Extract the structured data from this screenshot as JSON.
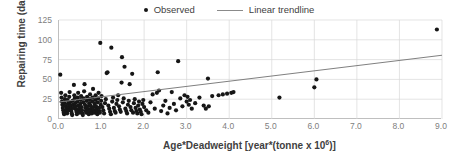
{
  "chart_data": {
    "type": "scatter",
    "title": "",
    "xlabel": "Age*Deadweight [year*(tonne x 10",
    "xlabel_sup": "6",
    "xlabel_tail": ")]",
    "ylabel": "Repairing time (day)",
    "xlim": [
      0,
      9
    ],
    "ylim": [
      0,
      125
    ],
    "xticks": [
      "0.0",
      "1.0",
      "2.0",
      "3.0",
      "4.0",
      "5.0",
      "6.0",
      "7.0",
      "8.0",
      "9.0"
    ],
    "xtick_values": [
      0,
      1,
      2,
      3,
      4,
      5,
      6,
      7,
      8,
      9
    ],
    "yticks": [
      "0",
      "25",
      "50",
      "75",
      "100",
      "125"
    ],
    "ytick_values": [
      0,
      25,
      50,
      75,
      100,
      125
    ],
    "grid": "both",
    "legend_position": "top-center",
    "marker_color": "#161616",
    "trend_color": "#808080",
    "grid_color": "#d9d9d9",
    "axis_color": "#bfbfbf",
    "legend": [
      {
        "label": "Observed",
        "kind": "marker"
      },
      {
        "label": "Linear trendline",
        "kind": "line"
      }
    ],
    "series": [
      {
        "name": "Observed",
        "kind": "scatter",
        "points": [
          [
            0.03,
            56
          ],
          [
            0.05,
            33
          ],
          [
            0.06,
            27
          ],
          [
            0.07,
            22
          ],
          [
            0.08,
            18
          ],
          [
            0.09,
            14
          ],
          [
            0.1,
            11
          ],
          [
            0.11,
            8
          ],
          [
            0.12,
            6
          ],
          [
            0.13,
            20
          ],
          [
            0.14,
            25
          ],
          [
            0.15,
            30
          ],
          [
            0.16,
            16
          ],
          [
            0.17,
            12
          ],
          [
            0.18,
            9
          ],
          [
            0.19,
            7
          ],
          [
            0.2,
            24
          ],
          [
            0.21,
            19
          ],
          [
            0.22,
            15
          ],
          [
            0.23,
            11
          ],
          [
            0.24,
            28
          ],
          [
            0.25,
            34
          ],
          [
            0.26,
            21
          ],
          [
            0.27,
            17
          ],
          [
            0.28,
            13
          ],
          [
            0.29,
            10
          ],
          [
            0.3,
            7
          ],
          [
            0.31,
            5
          ],
          [
            0.32,
            23
          ],
          [
            0.33,
            18
          ],
          [
            0.34,
            14
          ],
          [
            0.35,
            43
          ],
          [
            0.36,
            30
          ],
          [
            0.37,
            26
          ],
          [
            0.38,
            20
          ],
          [
            0.39,
            16
          ],
          [
            0.4,
            12
          ],
          [
            0.41,
            9
          ],
          [
            0.42,
            6
          ],
          [
            0.43,
            22
          ],
          [
            0.44,
            27
          ],
          [
            0.45,
            33
          ],
          [
            0.46,
            17
          ],
          [
            0.47,
            13
          ],
          [
            0.48,
            10
          ],
          [
            0.49,
            8
          ],
          [
            0.5,
            19
          ],
          [
            0.51,
            24
          ],
          [
            0.52,
            29
          ],
          [
            0.53,
            15
          ],
          [
            0.54,
            11
          ],
          [
            0.55,
            7
          ],
          [
            0.56,
            5
          ],
          [
            0.57,
            21
          ],
          [
            0.58,
            26
          ],
          [
            0.59,
            35
          ],
          [
            0.6,
            44
          ],
          [
            0.61,
            18
          ],
          [
            0.62,
            14
          ],
          [
            0.63,
            10
          ],
          [
            0.64,
            8
          ],
          [
            0.65,
            23
          ],
          [
            0.66,
            28
          ],
          [
            0.67,
            16
          ],
          [
            0.68,
            12
          ],
          [
            0.69,
            9
          ],
          [
            0.7,
            6
          ],
          [
            0.71,
            20
          ],
          [
            0.72,
            25
          ],
          [
            0.73,
            31
          ],
          [
            0.74,
            17
          ],
          [
            0.75,
            13
          ],
          [
            0.76,
            10
          ],
          [
            0.77,
            7
          ],
          [
            0.78,
            22
          ],
          [
            0.79,
            27
          ],
          [
            0.8,
            38
          ],
          [
            0.81,
            15
          ],
          [
            0.82,
            11
          ],
          [
            0.83,
            8
          ],
          [
            0.84,
            19
          ],
          [
            0.85,
            24
          ],
          [
            0.86,
            30
          ],
          [
            0.87,
            16
          ],
          [
            0.88,
            12
          ],
          [
            0.89,
            9
          ],
          [
            0.9,
            6
          ],
          [
            0.91,
            21
          ],
          [
            0.92,
            26
          ],
          [
            0.93,
            33
          ],
          [
            0.94,
            14
          ],
          [
            0.95,
            10
          ],
          [
            0.96,
            8
          ],
          [
            0.97,
            96
          ],
          [
            0.98,
            18
          ],
          [
            0.99,
            23
          ],
          [
            1.0,
            29
          ],
          [
            1.02,
            15
          ],
          [
            1.04,
            11
          ],
          [
            1.06,
            7
          ],
          [
            1.08,
            20
          ],
          [
            1.1,
            25
          ],
          [
            1.12,
            58
          ],
          [
            1.14,
            59
          ],
          [
            1.16,
            17
          ],
          [
            1.18,
            13
          ],
          [
            1.2,
            9
          ],
          [
            1.22,
            6
          ],
          [
            1.23,
            90
          ],
          [
            1.25,
            22
          ],
          [
            1.27,
            27
          ],
          [
            1.29,
            14
          ],
          [
            1.31,
            10
          ],
          [
            1.33,
            8
          ],
          [
            1.35,
            19
          ],
          [
            1.37,
            24
          ],
          [
            1.39,
            30
          ],
          [
            1.41,
            16
          ],
          [
            1.43,
            12
          ],
          [
            1.45,
            9
          ],
          [
            1.47,
            46
          ],
          [
            1.48,
            78
          ],
          [
            1.5,
            21
          ],
          [
            1.52,
            26
          ],
          [
            1.54,
            66
          ],
          [
            1.56,
            13
          ],
          [
            1.58,
            10
          ],
          [
            1.6,
            7
          ],
          [
            1.62,
            18
          ],
          [
            1.64,
            23
          ],
          [
            1.66,
            44
          ],
          [
            1.68,
            15
          ],
          [
            1.7,
            11
          ],
          [
            1.72,
            57
          ],
          [
            1.74,
            8
          ],
          [
            1.76,
            20
          ],
          [
            1.78,
            25
          ],
          [
            1.8,
            14
          ],
          [
            1.82,
            10
          ],
          [
            1.84,
            7
          ],
          [
            1.86,
            17
          ],
          [
            1.88,
            22
          ],
          [
            1.9,
            12
          ],
          [
            1.92,
            9
          ],
          [
            1.94,
            6
          ],
          [
            1.96,
            19
          ],
          [
            1.98,
            24
          ],
          [
            2.0,
            15
          ],
          [
            2.05,
            11
          ],
          [
            2.1,
            8
          ],
          [
            2.15,
            21
          ],
          [
            2.2,
            31
          ],
          [
            2.25,
            13
          ],
          [
            2.3,
            33
          ],
          [
            2.32,
            59
          ],
          [
            2.35,
            36
          ],
          [
            2.4,
            10
          ],
          [
            2.45,
            17
          ],
          [
            2.5,
            23
          ],
          [
            2.55,
            7
          ],
          [
            2.6,
            14
          ],
          [
            2.65,
            34
          ],
          [
            2.7,
            19
          ],
          [
            2.75,
            11
          ],
          [
            2.8,
            73
          ],
          [
            2.85,
            26
          ],
          [
            2.9,
            16
          ],
          [
            2.95,
            30
          ],
          [
            3.0,
            22
          ],
          [
            3.02,
            28
          ],
          [
            3.05,
            18
          ],
          [
            3.08,
            24
          ],
          [
            3.12,
            13
          ],
          [
            3.2,
            20
          ],
          [
            3.3,
            27
          ],
          [
            3.4,
            17
          ],
          [
            3.45,
            13
          ],
          [
            3.5,
            51
          ],
          [
            3.52,
            16
          ],
          [
            3.6,
            29
          ],
          [
            3.75,
            30
          ],
          [
            3.85,
            31
          ],
          [
            3.95,
            32
          ],
          [
            4.05,
            33
          ],
          [
            4.1,
            34
          ],
          [
            5.18,
            27
          ],
          [
            6.0,
            40
          ],
          [
            6.05,
            50
          ],
          [
            8.88,
            113
          ]
        ]
      },
      {
        "name": "Linear trendline",
        "kind": "line",
        "points": [
          [
            0,
            21.5
          ],
          [
            9,
            80.5
          ]
        ]
      }
    ]
  }
}
